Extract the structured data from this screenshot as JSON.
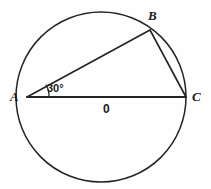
{
  "figure": {
    "kind": "circle-geometry-diagram",
    "background_color": "#fefefe",
    "stroke_color": "#232323",
    "width": 211,
    "height": 189
  },
  "circle": {
    "name": "circle-O",
    "center_x": 101,
    "center_y": 97,
    "radius": 85
  },
  "points": {
    "A": {
      "label": "A",
      "x": 27,
      "y": 97
    },
    "B": {
      "label": "B",
      "x": 150,
      "y": 30
    },
    "C": {
      "label": "C",
      "x": 186,
      "y": 97
    },
    "O": {
      "label": "0",
      "x": 101,
      "y": 97
    }
  },
  "segments": [
    {
      "name": "chord-AB",
      "from": "A",
      "to": "B"
    },
    {
      "name": "chord-BC",
      "from": "B",
      "to": "C"
    },
    {
      "name": "diameter-AC",
      "from": "A",
      "to": "C"
    }
  ],
  "angles": [
    {
      "name": "angle-BAC",
      "vertex": "A",
      "label": "30°",
      "value": 30,
      "unit": "degrees"
    }
  ]
}
